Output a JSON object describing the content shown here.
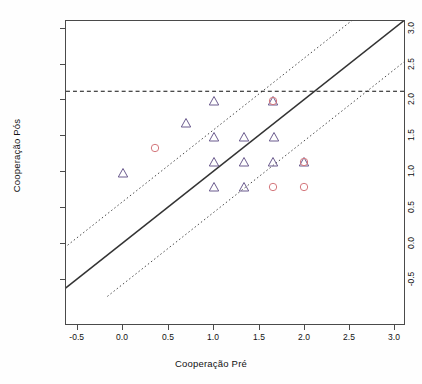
{
  "chart_data": {
    "type": "scatter",
    "title": "",
    "xlabel": "Cooperação Pré",
    "ylabel": "Cooperação Pós",
    "xlim": [
      -0.75,
      3.25
    ],
    "ylim": [
      -0.75,
      3.25
    ],
    "xticks": [
      "-0.5",
      "0.0",
      "0.5",
      "1.0",
      "1.5",
      "2.0",
      "2.5",
      "3.0"
    ],
    "xtick_values": [
      -0.5,
      0.0,
      0.5,
      1.0,
      1.5,
      2.0,
      2.5,
      3.0
    ],
    "yticks": [
      "-0.5",
      "0.0",
      "0.5",
      "1.0",
      "1.5",
      "2.0",
      "2.5",
      "3.0"
    ],
    "ytick_values": [
      -0.5,
      0.0,
      0.5,
      1.0,
      1.5,
      2.0,
      2.5,
      3.0
    ],
    "grid": false,
    "legend": "none",
    "series": [
      {
        "name": "triangles",
        "marker": "triangle",
        "color": "#6b5b8e",
        "points": [
          {
            "x": 0.0,
            "y": 1.0
          },
          {
            "x": 0.7,
            "y": 1.7
          },
          {
            "x": 1.0,
            "y": 2.0
          },
          {
            "x": 1.0,
            "y": 1.5
          },
          {
            "x": 1.0,
            "y": 1.15
          },
          {
            "x": 1.0,
            "y": 0.8
          },
          {
            "x": 1.33,
            "y": 1.5
          },
          {
            "x": 1.33,
            "y": 1.15
          },
          {
            "x": 1.33,
            "y": 0.8
          },
          {
            "x": 1.65,
            "y": 2.0
          },
          {
            "x": 1.67,
            "y": 1.5
          },
          {
            "x": 1.65,
            "y": 1.15
          },
          {
            "x": 2.0,
            "y": 1.15
          }
        ]
      },
      {
        "name": "circles",
        "marker": "circle",
        "color": "#d4777c",
        "points": [
          {
            "x": 0.35,
            "y": 1.35
          },
          {
            "x": 1.65,
            "y": 2.0
          },
          {
            "x": 1.65,
            "y": 0.8
          },
          {
            "x": 2.0,
            "y": 1.15
          },
          {
            "x": 2.0,
            "y": 0.8
          }
        ]
      }
    ],
    "reference_lines": [
      {
        "name": "identity-line",
        "style": "solid",
        "slope": 1,
        "intercept": 0.0
      },
      {
        "name": "upper-ci-line",
        "style": "dotted",
        "slope": 1,
        "intercept": 0.58
      },
      {
        "name": "lower-ci-line",
        "style": "dotted",
        "slope": 1,
        "intercept": -0.58
      },
      {
        "name": "horizontal-threshold",
        "style": "dashed",
        "y": 2.13
      }
    ]
  },
  "axes": {
    "x_title": "Cooperação Pré",
    "y_title": "Cooperação Pós"
  }
}
